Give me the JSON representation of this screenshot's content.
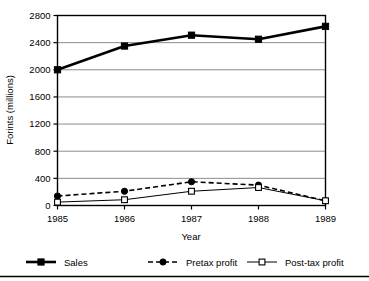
{
  "chart_data": {
    "type": "line",
    "title": "",
    "xlabel": "Year",
    "ylabel": "Forints (millions)",
    "categories": [
      "1985",
      "1986",
      "1987",
      "1988",
      "1989"
    ],
    "x": [
      1985,
      1986,
      1987,
      1988,
      1989
    ],
    "xlim": [
      1985,
      1989
    ],
    "ylim": [
      0,
      2800
    ],
    "yticks": [
      0,
      400,
      800,
      1200,
      1600,
      2000,
      2400,
      2800
    ],
    "ytick_labels": [
      "0",
      "400",
      "800",
      "1200",
      "1600",
      "2000",
      "2400",
      "2800"
    ],
    "xtick_labels": [
      "1985",
      "1986",
      "1987",
      "1988",
      "1989"
    ],
    "grid": "horizontal",
    "legend_position": "bottom",
    "series": [
      {
        "name": "Sales",
        "values": [
          2000,
          2350,
          2510,
          2450,
          2640
        ],
        "line_style": "solid",
        "line_width": 2.6,
        "marker": "filled-square",
        "color": "#000000"
      },
      {
        "name": "Pretax profit",
        "values": [
          140,
          210,
          350,
          300,
          70
        ],
        "line_style": "dashed",
        "line_width": 1.6,
        "marker": "filled-circle",
        "color": "#000000"
      },
      {
        "name": "Post-tax profit",
        "values": [
          50,
          85,
          210,
          265,
          70
        ],
        "line_style": "solid",
        "line_width": 1.0,
        "marker": "open-square",
        "color": "#000000"
      }
    ]
  },
  "legend": {
    "items": [
      {
        "label": "Sales"
      },
      {
        "label": "Pretax profit"
      },
      {
        "label": "Post-tax profit"
      }
    ]
  },
  "colors": {
    "ink": "#000000",
    "grid": "#808080",
    "frame": "#000000",
    "background": "#ffffff"
  }
}
